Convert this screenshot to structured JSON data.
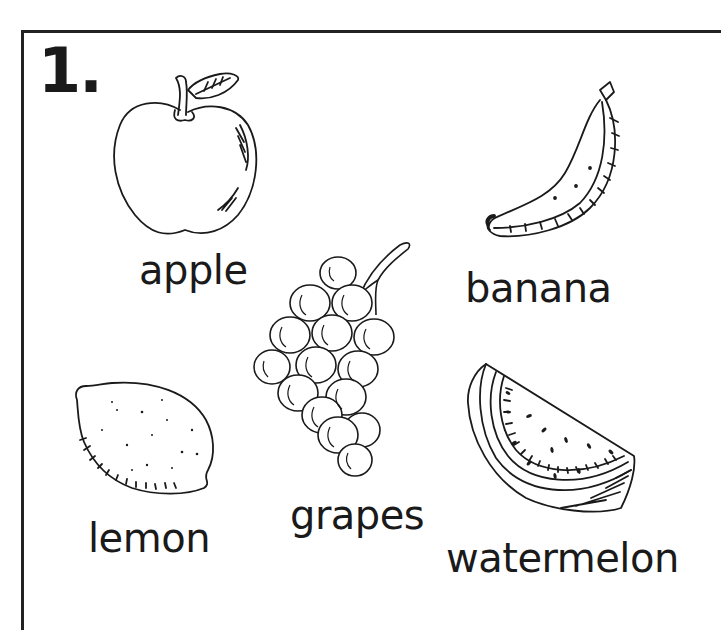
{
  "worksheet": {
    "number": "1.",
    "items": [
      {
        "id": "apple",
        "label": "apple",
        "icon": "apple-icon"
      },
      {
        "id": "banana",
        "label": "banana",
        "icon": "banana-icon"
      },
      {
        "id": "grapes",
        "label": "grapes",
        "icon": "grapes-icon"
      },
      {
        "id": "lemon",
        "label": "lemon",
        "icon": "lemon-icon"
      },
      {
        "id": "watermelon",
        "label": "watermelon",
        "icon": "watermelon-icon"
      }
    ]
  },
  "colors": {
    "line": "#1a1a1a",
    "background": "#ffffff"
  }
}
